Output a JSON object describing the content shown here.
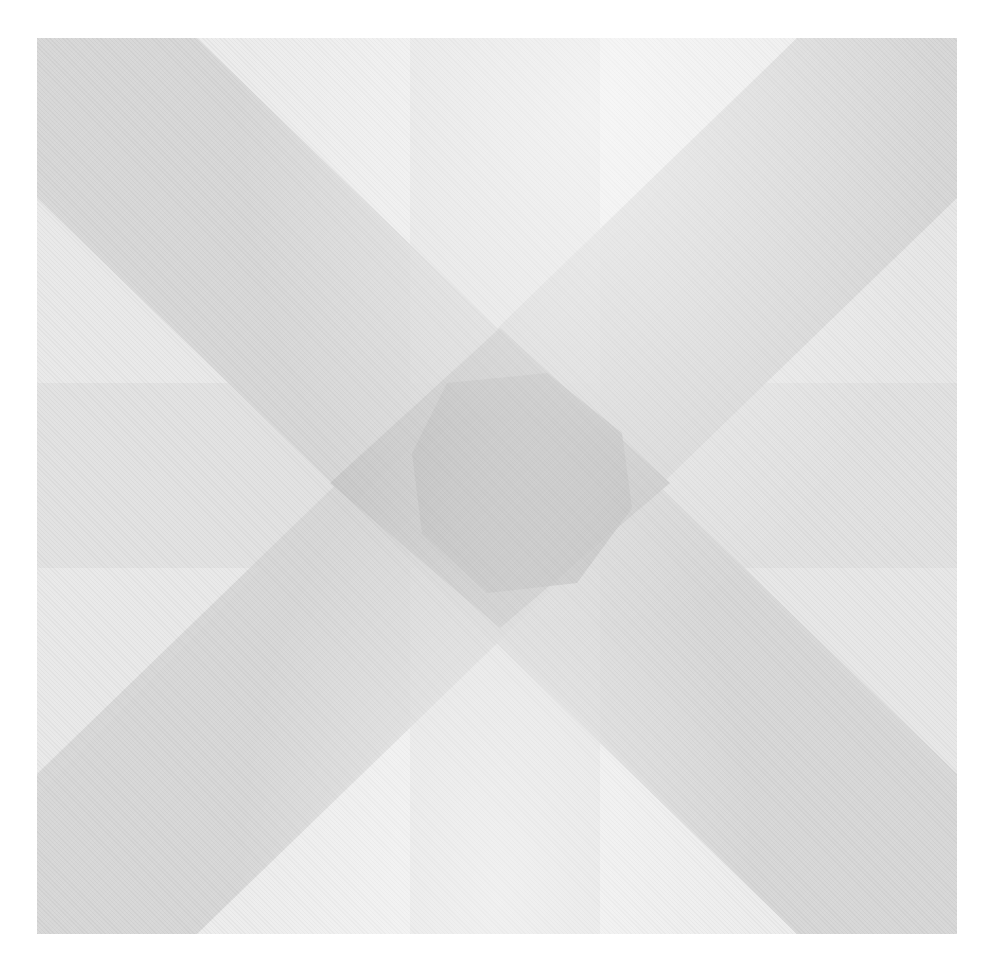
{
  "artwork": {
    "description": "Abstract grayscale geometric composition: diagonal X bands, vertical and horizontal bands, darker central diamond",
    "canvas": {
      "x": 37,
      "y": 38,
      "width": 920,
      "height": 896
    },
    "colors": {
      "background": "#ffffff",
      "base": "#e6e6e6",
      "light_triangle": "#ededed",
      "diagonal_band": "#d6d6d6",
      "vertical_band": "#e2e2e2",
      "horizontal_band": "#dedede",
      "center_diamond": "#c4c4c4",
      "center_core": "#bbbbbb"
    }
  }
}
